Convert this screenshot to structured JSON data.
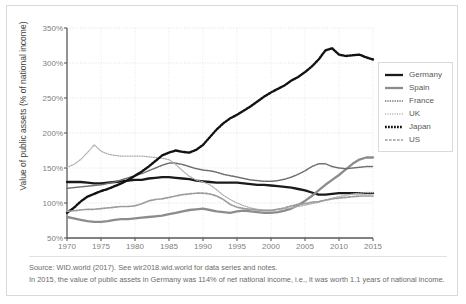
{
  "chart_data": {
    "type": "line",
    "title": "",
    "xlabel": "",
    "ylabel": "Value of public assets (% of national income)",
    "xlim": [
      1970,
      2015
    ],
    "ylim": [
      50,
      350
    ],
    "ytick_labels": [
      "50%",
      "100%",
      "150%",
      "200%",
      "250%",
      "300%",
      "350%"
    ],
    "ytick_values": [
      50,
      100,
      150,
      200,
      250,
      300,
      350
    ],
    "xtick_labels": [
      "1970",
      "1975",
      "1980",
      "1985",
      "1990",
      "1995",
      "2000",
      "2005",
      "2010",
      "2015"
    ],
    "xtick_values": [
      1970,
      1975,
      1980,
      1985,
      1990,
      1995,
      2000,
      2005,
      2010,
      2015
    ],
    "grid": true,
    "legend_position": "right",
    "x": [
      1970,
      1971,
      1972,
      1973,
      1974,
      1975,
      1976,
      1977,
      1978,
      1979,
      1980,
      1981,
      1982,
      1983,
      1984,
      1985,
      1986,
      1987,
      1988,
      1989,
      1990,
      1991,
      1992,
      1993,
      1994,
      1995,
      1996,
      1997,
      1998,
      1999,
      2000,
      2001,
      2002,
      2003,
      2004,
      2005,
      2006,
      2007,
      2008,
      2009,
      2010,
      2011,
      2012,
      2013,
      2014,
      2015
    ],
    "series": [
      {
        "name": "Germany",
        "color": "#1a1a1a",
        "style": "solid-thick",
        "values": [
          130,
          130,
          130,
          129,
          128,
          128,
          129,
          130,
          131,
          132,
          133,
          133,
          135,
          136,
          137,
          137,
          136,
          135,
          134,
          132,
          131,
          130,
          129,
          129,
          129,
          129,
          128,
          127,
          126,
          126,
          125,
          124,
          123,
          122,
          120,
          118,
          115,
          112,
          112,
          113,
          114,
          114,
          114,
          114,
          114,
          114
        ]
      },
      {
        "name": "Spain",
        "color": "#8c8c8c",
        "style": "solid-thick",
        "values": [
          80,
          78,
          76,
          74,
          73,
          73,
          74,
          76,
          77,
          77,
          78,
          79,
          80,
          81,
          82,
          84,
          86,
          88,
          90,
          91,
          92,
          90,
          88,
          87,
          86,
          88,
          89,
          88,
          87,
          86,
          86,
          87,
          89,
          92,
          97,
          103,
          110,
          118,
          126,
          133,
          140,
          148,
          156,
          162,
          165,
          165
        ]
      },
      {
        "name": "France",
        "color": "#6e6e6e",
        "style": "dotted-fine",
        "values": [
          121,
          122,
          123,
          124,
          125,
          126,
          128,
          130,
          133,
          136,
          139,
          142,
          146,
          150,
          154,
          157,
          157,
          155,
          152,
          149,
          147,
          146,
          144,
          141,
          139,
          137,
          135,
          133,
          132,
          131,
          131,
          132,
          134,
          137,
          141,
          146,
          152,
          156,
          156,
          152,
          150,
          149,
          150,
          151,
          152,
          152
        ]
      },
      {
        "name": "UK",
        "color": "#adadad",
        "style": "dotted-light",
        "values": [
          151,
          155,
          162,
          172,
          183,
          174,
          170,
          168,
          167,
          167,
          167,
          167,
          166,
          165,
          164,
          162,
          155,
          146,
          138,
          133,
          130,
          126,
          119,
          111,
          105,
          100,
          96,
          93,
          91,
          90,
          90,
          91,
          92,
          93,
          95,
          97,
          99,
          101,
          104,
          107,
          109,
          111,
          113,
          114,
          115,
          115
        ]
      },
      {
        "name": "Japan",
        "color": "#121212",
        "style": "dotted-bold",
        "values": [
          86,
          93,
          102,
          109,
          113,
          117,
          120,
          124,
          128,
          133,
          139,
          145,
          152,
          160,
          168,
          172,
          175,
          173,
          172,
          176,
          183,
          194,
          205,
          214,
          221,
          226,
          232,
          238,
          245,
          252,
          258,
          263,
          268,
          275,
          280,
          287,
          295,
          305,
          318,
          321,
          312,
          310,
          311,
          312,
          308,
          305
        ]
      },
      {
        "name": "US",
        "color": "#9c9c9c",
        "style": "dashed",
        "values": [
          88,
          89,
          90,
          91,
          91,
          92,
          93,
          94,
          95,
          95,
          96,
          99,
          103,
          105,
          106,
          108,
          110,
          112,
          113,
          114,
          114,
          113,
          110,
          105,
          98,
          94,
          92,
          91,
          90,
          89,
          89,
          91,
          93,
          96,
          98,
          99,
          101,
          102,
          104,
          106,
          107,
          108,
          109,
          110,
          110,
          110
        ]
      }
    ]
  },
  "footer": {
    "source_line": "Source: WID.world (2017). See wir2018.wid.world for data series and notes.",
    "note_line": "In 2015, the value of public assets in Germany was 114% of net national income, i.e., it was worth 1.1 years of national income."
  }
}
